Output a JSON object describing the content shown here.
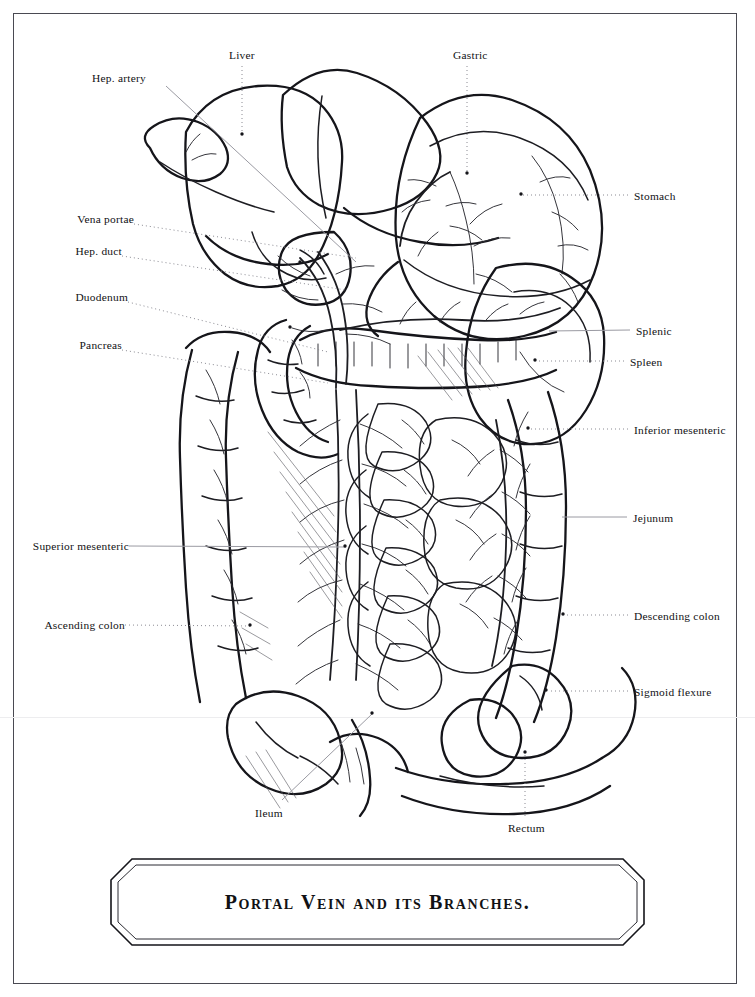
{
  "plate": {
    "title": "Portal Vein and its Branches.",
    "background_color": "#ffffff",
    "ink_color": "#1a1a1a",
    "frame_color": "#4a4a52"
  },
  "labels": {
    "left": [
      {
        "id": "hep-artery",
        "text": "Hep. artery",
        "x": 92,
        "y": 72,
        "leader": "line",
        "to_x": 355,
        "to_y": 260
      },
      {
        "id": "vena-portae",
        "text": "Vena portae",
        "x": 57,
        "y": 218,
        "leader": "dotted",
        "to_x": 358,
        "to_y": 258
      },
      {
        "id": "hep-duct",
        "text": "Hep. duct",
        "x": 66,
        "y": 250,
        "leader": "dotted",
        "to_x": 348,
        "to_y": 290
      },
      {
        "id": "duodenum",
        "text": "Duodenum",
        "x": 64,
        "y": 296,
        "leader": "dotted",
        "to_x": 330,
        "to_y": 352
      },
      {
        "id": "pancreas",
        "text": "Pancreas",
        "x": 72,
        "y": 344,
        "leader": "dotted",
        "to_x": 330,
        "to_y": 383
      },
      {
        "id": "superior-mesenteric",
        "text": "Superior mesenteric",
        "x": 23,
        "y": 540,
        "leader": "line",
        "to_x": 345,
        "to_y": 546
      },
      {
        "id": "ascending-colon",
        "text": "Ascending colon",
        "x": 39,
        "y": 620,
        "leader": "dotted",
        "to_x": 250,
        "to_y": 625
      },
      {
        "id": "ileum",
        "text": "Ileum",
        "x": 255,
        "y": 807,
        "leader": "line",
        "to_x": 372,
        "to_y": 713
      }
    ],
    "top": [
      {
        "id": "liver",
        "text": "Liver",
        "x": 229,
        "y": 49,
        "leader": "dotted",
        "to_x": 242,
        "to_y": 134
      },
      {
        "id": "gastric",
        "text": "Gastric",
        "x": 453,
        "y": 49,
        "leader": "dotted",
        "to_x": 467,
        "to_y": 173
      }
    ],
    "right": [
      {
        "id": "stomach",
        "text": "Stomach",
        "x": 634,
        "y": 191,
        "leader": "dotted",
        "to_x": 521,
        "to_y": 194
      },
      {
        "id": "splenic",
        "text": "Splenic",
        "x": 636,
        "y": 326,
        "leader": "line",
        "to_x": 548,
        "to_y": 330
      },
      {
        "id": "spleen",
        "text": "Spleen",
        "x": 630,
        "y": 357,
        "leader": "dotted",
        "to_x": 535,
        "to_y": 360
      },
      {
        "id": "inferior-mesenteric",
        "text": "Inferior mesenteric",
        "x": 634,
        "y": 425,
        "leader": "dotted",
        "to_x": 528,
        "to_y": 428
      },
      {
        "id": "jejunum",
        "text": "Jejunum",
        "x": 633,
        "y": 513,
        "leader": "line",
        "to_x": 561,
        "to_y": 516
      },
      {
        "id": "descending-colon",
        "text": "Descending colon",
        "x": 634,
        "y": 611,
        "leader": "dotted",
        "to_x": 563,
        "to_y": 614
      },
      {
        "id": "sigmoid-flexure",
        "text": "Sigmoid flexure",
        "x": 634,
        "y": 687,
        "leader": "dotted",
        "to_x": 546,
        "to_y": 690
      }
    ],
    "bottom": [
      {
        "id": "rectum",
        "text": "Rectum",
        "x": 508,
        "y": 823,
        "leader": "dotted",
        "to_x": 525,
        "to_y": 755
      }
    ]
  }
}
